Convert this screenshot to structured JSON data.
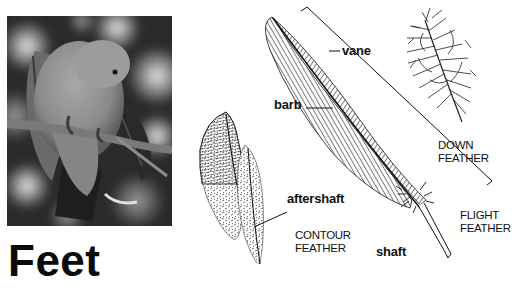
{
  "page": {
    "heading": "Feet",
    "top_cutoff_text": ""
  },
  "photo": {
    "subject": "bird preening on branch",
    "alt": "Grey bird preening its feathers while perched on a branch"
  },
  "diagram": {
    "part_labels": {
      "vane": "vane",
      "barb": "barb",
      "aftershaft": "aftershaft",
      "shaft": "shaft"
    },
    "feather_types": {
      "down": [
        "DOWN",
        "FEATHER"
      ],
      "contour": [
        "CONTOUR",
        "FEATHER"
      ],
      "flight": [
        "FLIGHT",
        "FEATHER"
      ]
    }
  },
  "colors": {
    "ink": "#111111",
    "background": "#ffffff"
  }
}
